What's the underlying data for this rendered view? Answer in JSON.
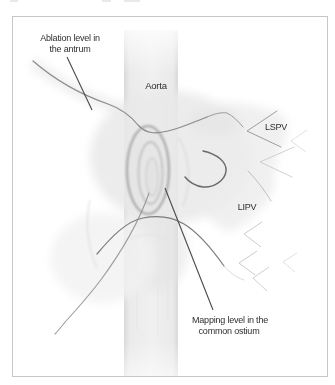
{
  "figure": {
    "labels": {
      "ablation_line1": "Ablation level in",
      "ablation_line2": "the antrum",
      "aorta": "Aorta",
      "lspv": "LSPV",
      "lipv": "LIPV",
      "mapping_line1": "Mapping level in the",
      "mapping_line2": "common ostium"
    },
    "colors": {
      "background": "#ffffff",
      "frame_border": "#c7c7c7",
      "label_text": "#2e2e2e",
      "pointer_line": "#4a4a4a",
      "vessel_dark": "#6a6a6a",
      "vessel_mid": "#8b8b8b",
      "vessel_light": "#bcbcbc",
      "aorta_band_center": "#f0f0f0",
      "aorta_band_edge": "#d9d9d9",
      "band_edge_line": "#c9c9c9",
      "ostium_ring_outer": "#9f9f9f",
      "ostium_ring_inner": "#b9b9b9",
      "soft_tissue": "#e9e9e9"
    }
  }
}
